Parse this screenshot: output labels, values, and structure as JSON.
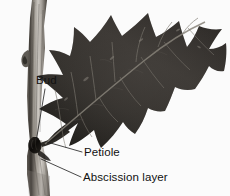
{
  "figure": {
    "kind": "botanical-photograph-diagram",
    "background_color": "#fbfbfb",
    "leader_line_color": "#1a1a1a",
    "label_text_color": "#111111"
  },
  "specimen": {
    "twig": {
      "name": "twig",
      "description": "woody gray-brown stem running from upper-left to lower-left",
      "color_light": "#d8d6d2",
      "color_mid": "#9a958e",
      "color_dark": "#4b4742"
    },
    "leaf": {
      "name": "oak-leaf",
      "description": "deeply lobed dark oak leaf angled up and to the right",
      "color_dark": "#2a2724",
      "color_mid": "#3c3834",
      "vein_color": "#7d7a74"
    },
    "bud": {
      "name": "axillary-bud",
      "description": "small dark bud in the leaf axil at the twig-petiole junction",
      "color": "#14120f"
    }
  },
  "annotations": [
    {
      "id": "bud",
      "label": "Bud",
      "leader": {
        "x1": 45,
        "y1": 89,
        "x2": 36.5,
        "y2": 139
      }
    },
    {
      "id": "petiole",
      "label": "Petiole",
      "leader": {
        "x1": 47,
        "y1": 142,
        "x2": 82,
        "y2": 152
      }
    },
    {
      "id": "abscission-layer",
      "label": "Abscission layer",
      "leader": {
        "x1": 41,
        "y1": 159,
        "x2": 81,
        "y2": 177
      }
    }
  ]
}
